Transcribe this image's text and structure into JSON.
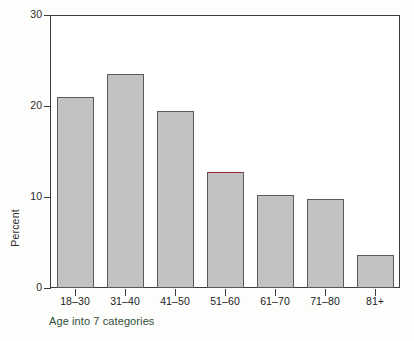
{
  "chart_data": {
    "type": "bar",
    "title": "",
    "subtitle": "",
    "xlabel": "Age into 7 categories",
    "ylabel": "Percent",
    "categories": [
      "18–30",
      "31–40",
      "41–50",
      "51–60",
      "61–70",
      "71–80",
      "81+"
    ],
    "values": [
      21.0,
      23.5,
      19.5,
      12.8,
      10.2,
      9.8,
      3.6
    ],
    "ylim": [
      0,
      30
    ],
    "yticks": [
      0,
      10,
      20,
      30
    ],
    "ytick_labels": [
      "0",
      "10",
      "20",
      "30"
    ],
    "grid": false,
    "legend": null,
    "legend_position": "none",
    "annotations": [
      {
        "category": "51–60",
        "note": "bar top edge drawn in dark red"
      }
    ]
  },
  "style": {
    "bar_fill": "#c2c2c2",
    "bar_border": "#5a5a5a",
    "highlight_border": "#8e2f32",
    "axis_color": "#3b3b3b",
    "tick_label_color": "#222222",
    "xlabel_color": "#2f4f3a",
    "ylabel_color": "#2e2e2e",
    "plot_background": "#ffffff",
    "page_background": "#fdfdfc"
  }
}
